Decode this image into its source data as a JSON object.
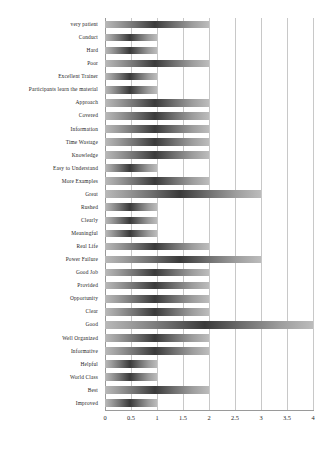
{
  "chart_data": {
    "type": "bar",
    "orientation": "horizontal",
    "title": "",
    "subtitle": "",
    "xlabel": "",
    "ylabel": "",
    "xlim": [
      0,
      4
    ],
    "ylim": null,
    "grid": true,
    "legend": null,
    "legend_position": "none",
    "xticks": [
      "0",
      "0.5",
      "1",
      "1.5",
      "2",
      "2.5",
      "3",
      "3.5",
      "4"
    ],
    "xtick_values": [
      0,
      0.5,
      1,
      1.5,
      2,
      2.5,
      3,
      3.5,
      4
    ],
    "categories": [
      "very patient",
      "Conduct",
      "Hard",
      "Poor",
      "Excellent Trainer",
      "Participants learn the material",
      "Approach",
      "Covered",
      "Information",
      "Time Wastage",
      "Knowledge",
      "Easy to Understand",
      "More Examples",
      "Great",
      "Rushed",
      "Clearly",
      "Meaningful",
      "Real Life",
      "Power Failure",
      "Good Job",
      "Provided",
      "Opportunity",
      "Clear",
      "Good",
      "Well Organized",
      "Informative",
      "Helpful",
      "World Class",
      "Best",
      "Improved"
    ],
    "values": [
      2,
      1,
      1,
      2,
      1,
      1,
      2,
      2,
      2,
      2,
      2,
      1,
      2,
      3,
      1,
      1,
      1,
      2,
      3,
      2,
      2,
      2,
      2,
      4,
      2,
      2,
      1,
      1,
      2,
      1
    ],
    "colors": {
      "bar_dark": "#3a3a3a",
      "bar_mid": "#8a8a8a",
      "bar_light": "#bcbcbc",
      "gridline": "#c8c8c8",
      "axis": "#9a9a9a",
      "text": "#242424",
      "background": "#ffffff"
    }
  }
}
